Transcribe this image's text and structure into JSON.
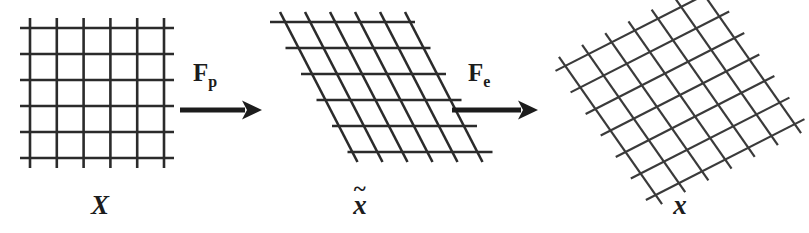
{
  "figure": {
    "name": "deformation-gradient-multiplicative-decomposition",
    "background_color": "#ffffff",
    "ink_color": "#2b2b2b",
    "width": 809,
    "height": 233
  },
  "panels": [
    {
      "id": "reference-configuration",
      "label": "X",
      "label_kind": "plain",
      "description": "undeformed regular square grid",
      "grid": {
        "type": "regular-square",
        "vertical_lines": 6,
        "horizontal_lines": 6,
        "x_start": 30,
        "x_end": 164,
        "y_start": 28,
        "y_end": 158,
        "spacing_x": 26.8,
        "spacing_y": 26.0,
        "overhang": 10
      }
    },
    {
      "id": "intermediate-configuration",
      "label": "x",
      "label_kind": "tilde",
      "label_accent": "~",
      "description": "plastically deformed stair-stepped sheared grid",
      "grid": {
        "type": "sheared-staircase",
        "vertical_lines": 6,
        "horizontal_lines": 6,
        "shear_step_x": 25,
        "shear_step_y": 26,
        "x_top_start": 280,
        "y_top": 22,
        "overhang": 10
      }
    },
    {
      "id": "current-configuration",
      "label": "x",
      "label_kind": "plain",
      "description": "elastically rotated and sheared grid",
      "grid": {
        "type": "rotated-sheared",
        "lines_family_a": 7,
        "lines_family_b": 7,
        "rotation_deg": -27,
        "shear_deg": 8,
        "center_x": 680,
        "center_y": 95,
        "spacing": 26
      }
    }
  ],
  "operators": [
    {
      "id": "plastic-map",
      "symbol": "F",
      "subscript": "p",
      "meaning": "plastic deformation gradient",
      "arrow": {
        "x_start": 180,
        "x_end": 262,
        "y": 110,
        "direction": "right"
      },
      "label_x": 193,
      "label_y": 60
    },
    {
      "id": "elastic-map",
      "symbol": "F",
      "subscript": "e",
      "meaning": "elastic deformation gradient",
      "arrow": {
        "x_start": 452,
        "x_end": 538,
        "y": 110,
        "direction": "right"
      },
      "label_x": 468,
      "label_y": 60
    }
  ],
  "labels": {
    "panel_reference": "X",
    "panel_intermediate": "x",
    "panel_intermediate_accent": "~",
    "panel_current": "x",
    "operator_plastic_symbol": "F",
    "operator_plastic_sub": "p",
    "operator_elastic_symbol": "F",
    "operator_elastic_sub": "e"
  }
}
